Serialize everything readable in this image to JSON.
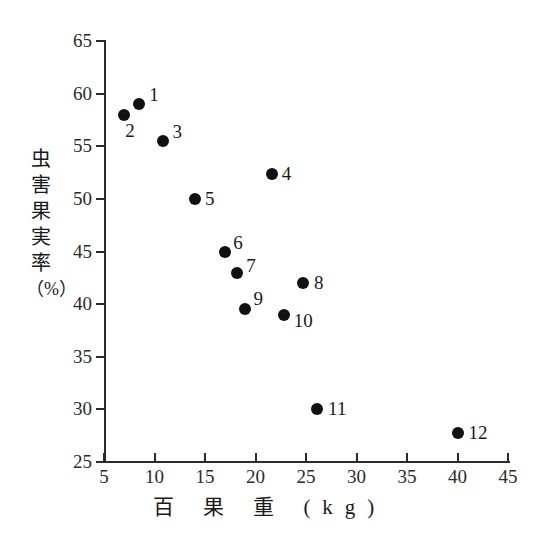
{
  "chart_data": {
    "type": "scatter",
    "title": "",
    "xlabel": "百 果 重 (kg)",
    "ylabel": "虫害果実率（%）",
    "ylabel_chars": [
      "虫",
      "害",
      "果",
      "実",
      "率",
      "（%）"
    ],
    "xlim": [
      5,
      45
    ],
    "ylim": [
      25,
      65
    ],
    "xticks": [
      5,
      10,
      15,
      20,
      25,
      30,
      35,
      40,
      45
    ],
    "yticks": [
      25,
      30,
      35,
      40,
      45,
      50,
      55,
      60,
      65
    ],
    "xticklabels": [
      "5",
      "10",
      "15",
      "20",
      "25",
      "30",
      "35",
      "40",
      "45"
    ],
    "yticklabels": [
      "25",
      "30",
      "35",
      "40",
      "45",
      "50",
      "55",
      "60",
      "65"
    ],
    "grid": false,
    "legend": false,
    "marker": "filled-circle",
    "marker_color": "#111111",
    "points": [
      {
        "label": "1",
        "x": 8.5,
        "y": 59.0,
        "label_dx": 10,
        "label_dy": -19
      },
      {
        "label": "2",
        "x": 7.0,
        "y": 58.0,
        "label_dx": 1,
        "label_dy": 6
      },
      {
        "label": "3",
        "x": 10.8,
        "y": 55.5,
        "label_dx": 10,
        "label_dy": -19
      },
      {
        "label": "4",
        "x": 21.6,
        "y": 52.4,
        "label_dx": 10,
        "label_dy": -10
      },
      {
        "label": "5",
        "x": 14.0,
        "y": 50.0,
        "label_dx": 10,
        "label_dy": -10
      },
      {
        "label": "6",
        "x": 17.0,
        "y": 45.0,
        "label_dx": 8,
        "label_dy": -19
      },
      {
        "label": "7",
        "x": 18.2,
        "y": 43.0,
        "label_dx": 9,
        "label_dy": -17
      },
      {
        "label": "8",
        "x": 24.7,
        "y": 42.0,
        "label_dx": 11,
        "label_dy": -10
      },
      {
        "label": "9",
        "x": 19.0,
        "y": 39.5,
        "label_dx": 8,
        "label_dy": -20
      },
      {
        "label": "10",
        "x": 22.8,
        "y": 39.0,
        "label_dx": 10,
        "label_dy": -4
      },
      {
        "label": "11",
        "x": 26.1,
        "y": 30.0,
        "label_dx": 11,
        "label_dy": -10
      },
      {
        "label": "12",
        "x": 40.0,
        "y": 27.8,
        "label_dx": 11,
        "label_dy": -10
      }
    ]
  }
}
